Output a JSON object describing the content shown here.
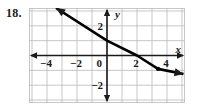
{
  "exercise": {
    "number": "18."
  },
  "chart_data": {
    "type": "line",
    "title": "",
    "xlabel": "x",
    "ylabel": "y",
    "xlim": [
      -5.2,
      5.2
    ],
    "ylim": [
      -3.2,
      3.2
    ],
    "grid": true,
    "grid_step": 1,
    "legend": null,
    "x_ticks": [
      {
        "value": -4,
        "label": "−4"
      },
      {
        "value": -2,
        "label": "−2"
      },
      {
        "value": 0,
        "label": "0"
      },
      {
        "value": 2,
        "label": "2"
      },
      {
        "value": 4,
        "label": "4"
      }
    ],
    "y_ticks": [
      {
        "value": 2,
        "label": "2"
      },
      {
        "value": -2,
        "label": "−2"
      }
    ],
    "series": [
      {
        "name": "line",
        "type": "line",
        "slope": -0.6667,
        "intercept": 1,
        "x_intercept": 2,
        "points": [
          {
            "x": -3.4,
            "y": 3.2
          },
          {
            "x": 0,
            "y": 1
          },
          {
            "x": 2,
            "y": 0
          },
          {
            "x": 3.4,
            "y": -0.9
          },
          {
            "x": 5.1,
            "y": -1.25
          }
        ],
        "arrows": [
          "start",
          "end"
        ],
        "color": "#000000"
      }
    ],
    "marked_points": [
      {
        "x": 3.4,
        "y": -0.9
      }
    ],
    "axis_arrows": [
      "left",
      "right",
      "up",
      "down"
    ],
    "colors": {
      "grid": "#b9b9b9",
      "axis": "#1a1a1a",
      "curve": "#000000",
      "text": "#1a1a1a",
      "background": "#ffffff"
    }
  }
}
